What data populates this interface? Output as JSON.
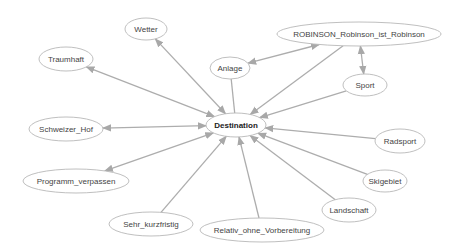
{
  "diagram": {
    "type": "network",
    "center_node": "Destination",
    "colors": {
      "edge": "#adadad",
      "node_border": "#b8b8b8",
      "text": "#444444",
      "background": "#ffffff"
    },
    "nodes": [
      {
        "id": "wetter",
        "label": "Wetter",
        "cx": 146,
        "cy": 29,
        "rx": 21,
        "ry": 11
      },
      {
        "id": "traumhaft",
        "label": "Traumhaft",
        "cx": 66,
        "cy": 59,
        "rx": 27,
        "ry": 12
      },
      {
        "id": "anlage",
        "label": "Anlage",
        "cx": 230,
        "cy": 68,
        "rx": 20,
        "ry": 11
      },
      {
        "id": "robinson",
        "label": "ROBINSON_Robinson_ist_Robinson",
        "cx": 359,
        "cy": 34,
        "rx": 82,
        "ry": 12
      },
      {
        "id": "sport",
        "label": "Sport",
        "cx": 365,
        "cy": 85,
        "rx": 22,
        "ry": 11
      },
      {
        "id": "destination",
        "label": "Destination",
        "cx": 236,
        "cy": 125,
        "rx": 30,
        "ry": 12
      },
      {
        "id": "schweizer_hof",
        "label": "Schweizer_Hof",
        "cx": 66,
        "cy": 129,
        "rx": 37,
        "ry": 12
      },
      {
        "id": "radsport",
        "label": "Radsport",
        "cx": 400,
        "cy": 141,
        "rx": 25,
        "ry": 12
      },
      {
        "id": "programm_verpassen",
        "label": "Programm_verpassen",
        "cx": 76,
        "cy": 181,
        "rx": 53,
        "ry": 12
      },
      {
        "id": "skigebiet",
        "label": "Skigebiet",
        "cx": 385,
        "cy": 181,
        "rx": 22,
        "ry": 11
      },
      {
        "id": "sehr_kurzfristig",
        "label": "Sehr_kurzfristig",
        "cx": 151,
        "cy": 224,
        "rx": 42,
        "ry": 12
      },
      {
        "id": "landschaft",
        "label": "Landschaft",
        "cx": 349,
        "cy": 210,
        "rx": 27,
        "ry": 12
      },
      {
        "id": "relativ",
        "label": "Relativ_ohne_Vorbereitung",
        "cx": 262,
        "cy": 230,
        "rx": 62,
        "ry": 12
      }
    ],
    "edges": [
      {
        "from": "wetter",
        "to": "destination",
        "direction": "both"
      },
      {
        "from": "traumhaft",
        "to": "destination",
        "direction": "both"
      },
      {
        "from": "anlage",
        "to": "destination",
        "direction": "none"
      },
      {
        "from": "anlage",
        "to": "robinson",
        "direction": "both"
      },
      {
        "from": "robinson",
        "to": "destination",
        "direction": "forward"
      },
      {
        "from": "robinson",
        "to": "sport",
        "direction": "both"
      },
      {
        "from": "sport",
        "to": "destination",
        "direction": "forward"
      },
      {
        "from": "schweizer_hof",
        "to": "destination",
        "direction": "both"
      },
      {
        "from": "radsport",
        "to": "destination",
        "direction": "forward"
      },
      {
        "from": "programm_verpassen",
        "to": "destination",
        "direction": "both"
      },
      {
        "from": "skigebiet",
        "to": "destination",
        "direction": "forward"
      },
      {
        "from": "sehr_kurzfristig",
        "to": "destination",
        "direction": "forward"
      },
      {
        "from": "landschaft",
        "to": "destination",
        "direction": "forward"
      },
      {
        "from": "relativ",
        "to": "destination",
        "direction": "forward"
      }
    ]
  }
}
